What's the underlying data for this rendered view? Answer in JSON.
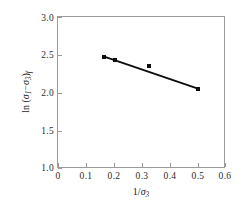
{
  "chart_data": {
    "type": "scatter",
    "title": "",
    "xlabel": "1/σ₃",
    "ylabel": "ln (σ₁−σ₃)f",
    "xlim": [
      0,
      0.6
    ],
    "ylim": [
      1.0,
      3.0
    ],
    "xticks": [
      "0",
      "0.1",
      "0.2",
      "0.3",
      "0.4",
      "0.5",
      "0.6"
    ],
    "xtick_values": [
      0,
      0.1,
      0.2,
      0.3,
      0.4,
      0.5,
      0.6
    ],
    "yticks": [
      "1.0",
      "1.5",
      "2.0",
      "2.5",
      "3.0"
    ],
    "ytick_values": [
      1.0,
      1.5,
      2.0,
      2.5,
      3.0
    ],
    "grid": false,
    "legend": "none",
    "series": [
      {
        "name": "measured points",
        "marker": "filled-square",
        "color": "#0d0d0d",
        "x": [
          0.165,
          0.205,
          0.325,
          0.5
        ],
        "y": [
          2.48,
          2.44,
          2.35,
          2.05
        ]
      },
      {
        "name": "fitted trend line",
        "type": "line",
        "color": "#0d0d0d",
        "x": [
          0.16,
          0.505
        ],
        "y": [
          2.485,
          2.05
        ]
      }
    ]
  },
  "axes": {
    "y_title": "ln (σ₁−σ₃)f",
    "y_title_parts": {
      "prefix": "ln (",
      "sigma1": "σ",
      "sub1": "1",
      "minus": "−",
      "sigma3": "σ",
      "sub3": "3",
      "close": ")",
      "subf": "f"
    },
    "x_title_parts": {
      "num": "1/",
      "sigma": "σ",
      "sub": "3"
    }
  },
  "colors": {
    "marker": "#0d0d0d",
    "line": "#0d0d0d",
    "frame": "#9a9a9a",
    "background": "#ffffff"
  }
}
